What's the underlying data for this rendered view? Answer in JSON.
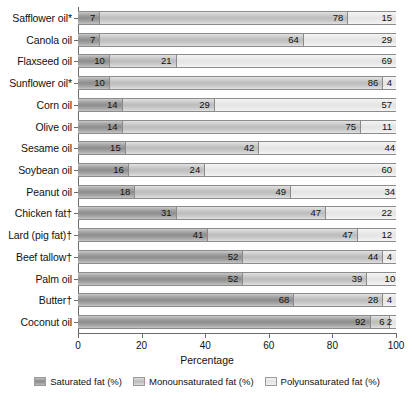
{
  "chart_data": {
    "type": "bar",
    "orientation": "horizontal",
    "stacked": true,
    "title": "",
    "xlabel": "Percentage",
    "ylabel": "",
    "xlim": [
      0,
      100
    ],
    "xticks": [
      0,
      20,
      40,
      60,
      80,
      100
    ],
    "grid": false,
    "legend_position": "bottom",
    "categories": [
      "Safflower oil*",
      "Canola oil",
      "Flaxseed oil",
      "Sunflower oil*",
      "Corn oil",
      "Olive oil",
      "Sesame oil",
      "Soybean oil",
      "Peanut oil",
      "Chicken fat†",
      "Lard (pig fat)†",
      "Beef tallow†",
      "Palm oil",
      "Butter†",
      "Coconut oil"
    ],
    "series": [
      {
        "name": "Saturated fat (%)",
        "color": "#8d8d8d",
        "values": [
          7,
          7,
          10,
          10,
          14,
          14,
          15,
          16,
          18,
          31,
          41,
          52,
          52,
          68,
          92
        ]
      },
      {
        "name": "Monounsaturated fat (%)",
        "color": "#bcbcbc",
        "values": [
          78,
          64,
          21,
          86,
          29,
          75,
          42,
          24,
          49,
          47,
          47,
          44,
          39,
          28,
          6
        ]
      },
      {
        "name": "Polyunsaturated fat (%)",
        "color": "#e4e4e4",
        "values": [
          15,
          29,
          69,
          4,
          57,
          11,
          44,
          60,
          34,
          22,
          12,
          4,
          10,
          4,
          2
        ]
      }
    ]
  },
  "axis": {
    "x_title": "Percentage",
    "x_tick_labels": [
      "0",
      "20",
      "40",
      "60",
      "80",
      "100"
    ]
  },
  "legend": {
    "items": [
      {
        "label": "Saturated fat (%)",
        "swatch": "sw-sat"
      },
      {
        "label": "Monounsaturated fat (%)",
        "swatch": "sw-mono"
      },
      {
        "label": "Polyunsaturated fat (%)",
        "swatch": "sw-poly"
      }
    ]
  }
}
